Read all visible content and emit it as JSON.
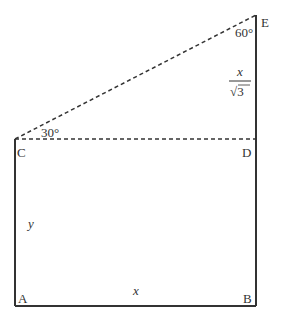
{
  "diagram": {
    "points": {
      "A": {
        "label": "A"
      },
      "B": {
        "label": "B"
      },
      "C": {
        "label": "C"
      },
      "D": {
        "label": "D"
      },
      "E": {
        "label": "E"
      }
    },
    "angles": {
      "C": "30°",
      "E": "60°"
    },
    "lengths": {
      "AB": "x",
      "AC": "y",
      "DE_numerator": "x",
      "DE_denominator": "√3"
    }
  }
}
